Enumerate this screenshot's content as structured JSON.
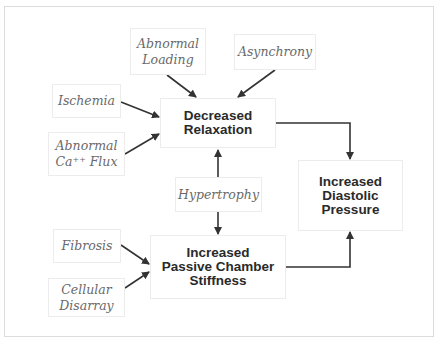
{
  "diagram": {
    "causes": {
      "abnormal_loading": "Abnormal\nLoading",
      "asynchrony": "Asynchrony",
      "ischemia": "Ischemia",
      "abnormal_ca_flux": "Abnormal\nCa⁺⁺ Flux",
      "hypertrophy": "Hypertrophy",
      "fibrosis": "Fibrosis",
      "cellular_disarray": "Cellular\nDisarray"
    },
    "effects": {
      "decreased_relaxation": "Decreased\nRelaxation",
      "increased_passive_chamber_stiffness": "Increased\nPassive Chamber\nStiffness",
      "increased_diastolic_pressure": "Increased\nDiastolic\nPressure"
    },
    "edges": [
      {
        "from": "Abnormal Loading",
        "to": "Decreased Relaxation"
      },
      {
        "from": "Asynchrony",
        "to": "Decreased Relaxation"
      },
      {
        "from": "Ischemia",
        "to": "Decreased Relaxation"
      },
      {
        "from": "Abnormal Ca++ Flux",
        "to": "Decreased Relaxation"
      },
      {
        "from": "Hypertrophy",
        "to": "Decreased Relaxation"
      },
      {
        "from": "Hypertrophy",
        "to": "Increased Passive Chamber Stiffness"
      },
      {
        "from": "Fibrosis",
        "to": "Increased Passive Chamber Stiffness"
      },
      {
        "from": "Cellular Disarray",
        "to": "Increased Passive Chamber Stiffness"
      },
      {
        "from": "Decreased Relaxation",
        "to": "Increased Diastolic Pressure"
      },
      {
        "from": "Increased Passive Chamber Stiffness",
        "to": "Increased Diastolic Pressure"
      }
    ],
    "colors": {
      "arrow": "#333333",
      "cause_text": "#6a6a6a",
      "effect_text": "#2a2a2a",
      "box_border": "#ececec"
    }
  }
}
